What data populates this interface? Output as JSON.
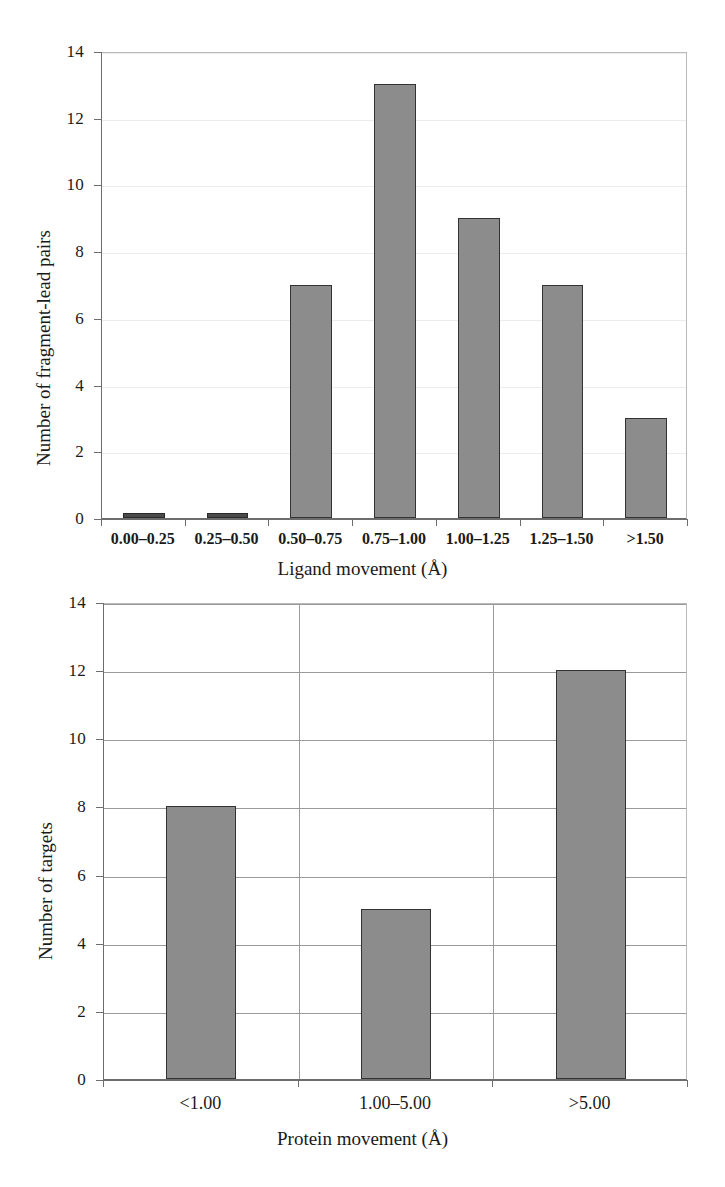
{
  "figure_top": {
    "name": "ligand-movement-histogram",
    "chart_data": {
      "type": "bar",
      "title": "",
      "xlabel": "Ligand movement (Å)",
      "ylabel": "Number of fragment-lead pairs",
      "categories": [
        "0.00–0.25",
        "0.25–0.50",
        "0.50–0.75",
        "0.75–1.00",
        "1.00–1.25",
        "1.25–1.50",
        ">1.50"
      ],
      "values": [
        0,
        0,
        7,
        13,
        9,
        7,
        3
      ],
      "ylim": [
        0,
        14
      ],
      "yticks": [
        0,
        2,
        4,
        6,
        8,
        10,
        12,
        14
      ],
      "ytick_labels": [
        "0",
        "2",
        "4",
        "6",
        "8",
        "10",
        "12",
        "14"
      ],
      "grid": true,
      "grid_color": "#ededed",
      "legend": "none",
      "bar_fill": "#8c8c8c",
      "bar_border": "#333333"
    }
  },
  "figure_bottom": {
    "name": "protein-movement-histogram",
    "chart_data": {
      "type": "bar",
      "title": "",
      "xlabel": "Protein movement (Å)",
      "ylabel": "Number of targets",
      "categories": [
        "<1.00",
        "1.00–5.00",
        ">5.00"
      ],
      "values": [
        8,
        5,
        12
      ],
      "ylim": [
        0,
        14
      ],
      "yticks": [
        0,
        2,
        4,
        6,
        8,
        10,
        12,
        14
      ],
      "ytick_labels": [
        "0",
        "2",
        "4",
        "6",
        "8",
        "10",
        "12",
        "14"
      ],
      "grid": true,
      "grid_color": "#9a9a9a",
      "legend": "none",
      "bar_fill": "#8c8c8c",
      "bar_border": "#333333"
    }
  }
}
